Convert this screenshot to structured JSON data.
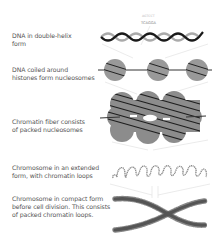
{
  "diagram": {
    "stages": [
      {
        "id": "double-helix",
        "label_line1": "DNA in double-helix",
        "label_line2": "form"
      },
      {
        "id": "nucleosomes",
        "label_line1": "DNA coiled around",
        "label_line2": "histones form nucleosomes"
      },
      {
        "id": "chromatin-fiber",
        "label_line1": "Chromatin fiber consists",
        "label_line2": "of packed nucleosomes"
      },
      {
        "id": "extended-chromosome",
        "label_line1": "Chromosome in an extended",
        "label_line2": "form, with chromatin loops"
      },
      {
        "id": "compact-chromosome",
        "label_line1": "Chromosome in compact form",
        "label_line2": "before cell division. This consists",
        "label_line3": "of packed chromatin loops."
      }
    ],
    "sequence": {
      "top_strand": "AGTCCT",
      "bottom_strand": "TCAGGA"
    },
    "colors": {
      "dna_dark": "#1a1a1a",
      "dna_light": "#aaaaaa",
      "histone_fill": "#999999",
      "fiber_fill": "#8c8c8c",
      "loop_stroke": "#888888",
      "chromosome": "#555555",
      "connector": "#dddddd",
      "label_text": "#555555"
    }
  }
}
